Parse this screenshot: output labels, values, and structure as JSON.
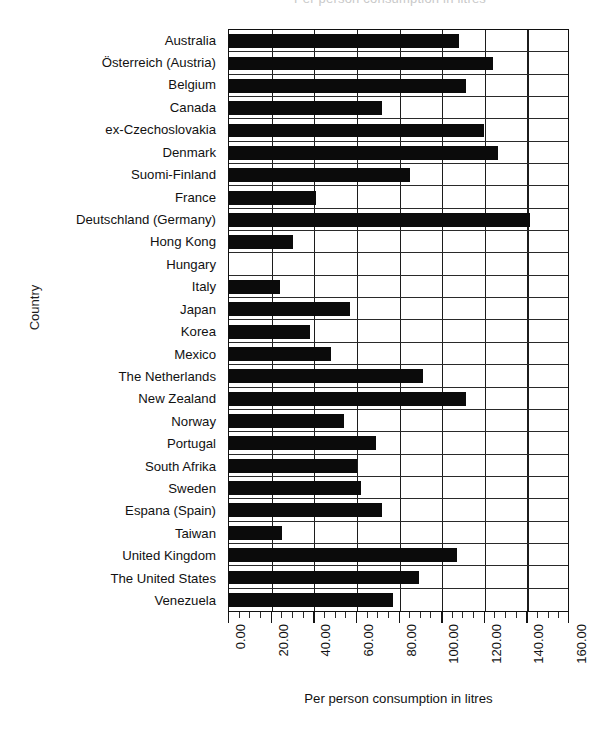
{
  "chart_data": {
    "type": "bar",
    "orientation": "horizontal",
    "title": "Per person consumption in litres",
    "xlabel": "Per person consumption in litres",
    "ylabel": "Country",
    "xlim": [
      0,
      160
    ],
    "xtick_step": 20,
    "xtick_minor_step": 5,
    "grid": true,
    "legend": "none",
    "bar_color": "#0b0b0b",
    "xticklabels": [
      "0.00",
      "20.00",
      "40.00",
      "60.00",
      "80.00",
      "100.00",
      "120.00",
      "140.00",
      "160.00"
    ],
    "categories": [
      "Australia",
      "Österreich (Austria)",
      "Belgium",
      "Canada",
      "ex-Czechoslovakia",
      "Denmark",
      "Suomi-Finland",
      "France",
      "Deutschland (Germany)",
      "Hong Kong",
      "Hungary",
      "Italy",
      "Japan",
      "Korea",
      "Mexico",
      "The Netherlands",
      "New Zealand",
      "Norway",
      "Portugal",
      "South Afrika",
      "Sweden",
      "Espana (Spain)",
      "Taiwan",
      "United Kingdom",
      "The United States",
      "Venezuela"
    ],
    "values": [
      108,
      124,
      111,
      72,
      119.5,
      126,
      85,
      41,
      141,
      30,
      0,
      24,
      57,
      38,
      48,
      91,
      111,
      54,
      69,
      60,
      62,
      72,
      25,
      107,
      89,
      77
    ]
  }
}
